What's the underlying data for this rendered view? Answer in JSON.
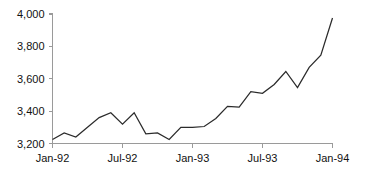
{
  "chart_data": {
    "type": "line",
    "title": "",
    "subtitle": "",
    "xlabel": "",
    "ylabel": "",
    "grid": false,
    "legend": false,
    "legend_position": "none",
    "ylim": [
      3200,
      4000
    ],
    "y_ticks": [
      3200,
      3400,
      3600,
      3800,
      4000
    ],
    "y_tick_labels": [
      "3,200",
      "3,400",
      "3,600",
      "3,800",
      "4,000"
    ],
    "x_ticks": [
      "Jan-92",
      "Jul-92",
      "Jan-93",
      "Jul-93",
      "Jan-94"
    ],
    "x_tick_labels": [
      "Jan-92",
      "Jul-92",
      "Jan-93",
      "Jul-93",
      "Jan-94"
    ],
    "x": [
      "Jan-92",
      "Feb-92",
      "Mar-92",
      "Apr-92",
      "May-92",
      "Jun-92",
      "Jul-92",
      "Aug-92",
      "Sep-92",
      "Oct-92",
      "Nov-92",
      "Dec-92",
      "Jan-93",
      "Feb-93",
      "Mar-93",
      "Apr-93",
      "May-93",
      "Jun-93",
      "Jul-93",
      "Aug-93",
      "Sep-93",
      "Oct-93",
      "Nov-93",
      "Dec-93",
      "Jan-94"
    ],
    "values": [
      3225,
      3265,
      3240,
      3300,
      3360,
      3390,
      3320,
      3390,
      3260,
      3265,
      3225,
      3300,
      3300,
      3305,
      3355,
      3430,
      3425,
      3520,
      3510,
      3565,
      3645,
      3545,
      3670,
      3745,
      3975
    ],
    "series": [
      {
        "name": "series-1",
        "color": "#2b2b2b",
        "values": [
          3225,
          3265,
          3240,
          3300,
          3360,
          3390,
          3320,
          3390,
          3260,
          3265,
          3225,
          3300,
          3300,
          3305,
          3355,
          3430,
          3425,
          3520,
          3510,
          3565,
          3645,
          3545,
          3670,
          3745,
          3975
        ]
      }
    ],
    "colors": {
      "line": "#2b2b2b",
      "axis": "#9a9a9a",
      "text": "#111111",
      "background": "#ffffff"
    }
  }
}
